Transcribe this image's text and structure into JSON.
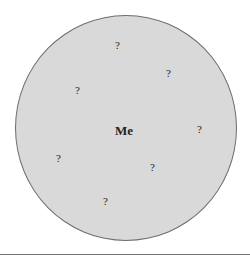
{
  "diagram": {
    "center_label": "Me",
    "unknowns": [
      {
        "label": "?",
        "x": 115,
        "y": 40
      },
      {
        "label": "?",
        "x": 166,
        "y": 68
      },
      {
        "label": "?",
        "x": 75,
        "y": 85
      },
      {
        "label": "?",
        "x": 197,
        "y": 124
      },
      {
        "label": "?",
        "x": 56,
        "y": 153
      },
      {
        "label": "?",
        "x": 150,
        "y": 162
      },
      {
        "label": "?",
        "x": 103,
        "y": 196
      }
    ],
    "colors": {
      "fill": "#d9d9d9",
      "stroke": "#6e6e6e",
      "text": "#222222"
    }
  }
}
